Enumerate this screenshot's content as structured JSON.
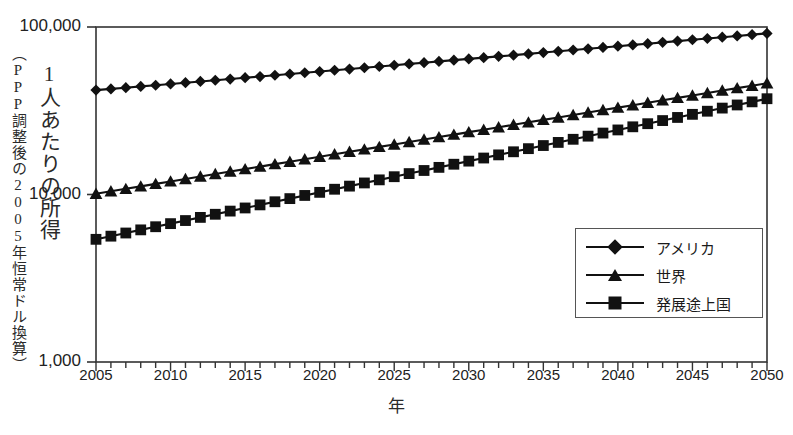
{
  "chart_data": {
    "type": "line",
    "title": "",
    "xlabel": "年",
    "ylabel": "1人あたりの所得",
    "ylabel_sub": "（PPP調整後の2005年恒常ドル換算）",
    "yscale": "log",
    "ylim": [
      1000,
      100000
    ],
    "xlim": [
      2005,
      2050
    ],
    "grid": false,
    "legend_position": "inside-bottom-right",
    "ytick_labels": [
      "100,000",
      "10,000",
      "1,000"
    ],
    "ytick_values": [
      100000,
      10000,
      1000
    ],
    "xtick_labels": [
      "2005",
      "2010",
      "2015",
      "2020",
      "2025",
      "2030",
      "2035",
      "2040",
      "2045",
      "2050"
    ],
    "xtick_values": [
      2005,
      2010,
      2015,
      2020,
      2025,
      2030,
      2035,
      2040,
      2045,
      2050
    ],
    "minor_xticks_every": 1,
    "x": [
      2005,
      2006,
      2007,
      2008,
      2009,
      2010,
      2011,
      2012,
      2013,
      2014,
      2015,
      2016,
      2017,
      2018,
      2019,
      2020,
      2021,
      2022,
      2023,
      2024,
      2025,
      2026,
      2027,
      2028,
      2029,
      2030,
      2031,
      2032,
      2033,
      2034,
      2035,
      2036,
      2037,
      2038,
      2039,
      2040,
      2041,
      2042,
      2043,
      2044,
      2045,
      2046,
      2047,
      2048,
      2049,
      2050
    ],
    "series": [
      {
        "name": "アメリカ",
        "marker": "diamond",
        "color": "#111111",
        "values": [
          42000,
          42700,
          43400,
          44200,
          44900,
          45700,
          46500,
          47300,
          48100,
          48900,
          49800,
          50600,
          51500,
          52400,
          53300,
          54200,
          55200,
          56100,
          57100,
          58100,
          59100,
          60200,
          61200,
          62300,
          63400,
          64500,
          65600,
          66800,
          67900,
          69100,
          70400,
          71600,
          72900,
          74100,
          75500,
          76800,
          78200,
          79500,
          81000,
          82400,
          83900,
          85400,
          86900,
          88400,
          90000,
          91600
        ]
      },
      {
        "name": "世界",
        "marker": "triangle",
        "color": "#111111",
        "values": [
          10100,
          10450,
          10810,
          11180,
          11570,
          11970,
          12380,
          12810,
          13250,
          13710,
          14180,
          14670,
          15180,
          15700,
          16240,
          16800,
          17380,
          17980,
          18600,
          19240,
          19900,
          20590,
          21290,
          22020,
          22780,
          23560,
          24370,
          25210,
          26070,
          26970,
          27900,
          28850,
          29840,
          30860,
          31920,
          33010,
          34130,
          35300,
          36500,
          37750,
          39030,
          40360,
          41730,
          43150,
          44620,
          46130
        ]
      },
      {
        "name": "発展途上国",
        "marker": "square",
        "color": "#111111",
        "values": [
          5400,
          5640,
          5890,
          6150,
          6420,
          6700,
          6990,
          7300,
          7620,
          7960,
          8310,
          8670,
          9050,
          9450,
          9870,
          10300,
          10750,
          11220,
          11720,
          12230,
          12770,
          13330,
          13910,
          14520,
          15160,
          15820,
          16510,
          17240,
          17990,
          18780,
          19600,
          20460,
          21360,
          22300,
          23270,
          24290,
          25360,
          26470,
          27630,
          28840,
          30100,
          31420,
          32800,
          34240,
          35740,
          37310
        ]
      }
    ]
  },
  "legend": {
    "entries": [
      {
        "label": "アメリカ",
        "marker": "diamond"
      },
      {
        "label": "世界",
        "marker": "triangle"
      },
      {
        "label": "発展途上国",
        "marker": "square"
      }
    ]
  }
}
